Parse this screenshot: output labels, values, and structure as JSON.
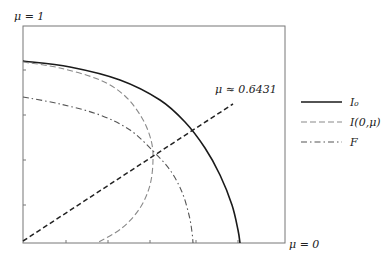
{
  "chart_data": {
    "type": "line",
    "title": "",
    "xlabel": "",
    "ylabel": "",
    "axis_labels": {
      "top_left": "μ = 1",
      "bottom_right": "μ = 0"
    },
    "annotation": {
      "text": "μ ≈ 0.6431",
      "x_px": 215,
      "y_px": 93
    },
    "grid": false,
    "legend_position": "right",
    "legend": [
      {
        "label": "I₀",
        "style": "solid",
        "color": "#1a1a1a"
      },
      {
        "label": "I(0,μ)",
        "style": "dashed",
        "color": "#8a8a8a"
      },
      {
        "label": "F",
        "style": "dashdot",
        "color": "#555555"
      }
    ],
    "frame_px": {
      "left": 23,
      "top": 26,
      "right": 285,
      "bottom": 243
    },
    "x_ticks_px": [
      66,
      108,
      150,
      196,
      238
    ],
    "y_ticks_px": [
      70,
      115,
      160,
      205
    ],
    "series": [
      {
        "name": "I₀",
        "style": "solid",
        "color": "#1a1a1a",
        "points_px": [
          [
            23,
            61
          ],
          [
            70,
            67
          ],
          [
            120,
            80
          ],
          [
            160,
            100
          ],
          [
            185,
            122
          ],
          [
            205,
            148
          ],
          [
            220,
            175
          ],
          [
            232,
            205
          ],
          [
            238,
            230
          ],
          [
            240,
            243
          ]
        ]
      },
      {
        "name": "I(0,μ)",
        "style": "dashed",
        "color": "#8a8a8a",
        "points_px": [
          [
            23,
            62
          ],
          [
            60,
            68
          ],
          [
            100,
            80
          ],
          [
            125,
            96
          ],
          [
            142,
            118
          ],
          [
            151,
            140
          ],
          [
            153,
            160
          ],
          [
            150,
            185
          ],
          [
            140,
            208
          ],
          [
            122,
            228
          ],
          [
            97,
            243
          ]
        ]
      },
      {
        "name": "F",
        "style": "dashdot",
        "color": "#555555",
        "points_px": [
          [
            23,
            97
          ],
          [
            60,
            104
          ],
          [
            100,
            115
          ],
          [
            130,
            130
          ],
          [
            152,
            150
          ],
          [
            170,
            170
          ],
          [
            182,
            192
          ],
          [
            189,
            215
          ],
          [
            192,
            232
          ],
          [
            193,
            243
          ]
        ]
      },
      {
        "name": "μ ≈ 0.6431 line",
        "style": "dashed",
        "color": "#222222",
        "points_px": [
          [
            23,
            241
          ],
          [
            233,
            104
          ]
        ]
      }
    ]
  }
}
